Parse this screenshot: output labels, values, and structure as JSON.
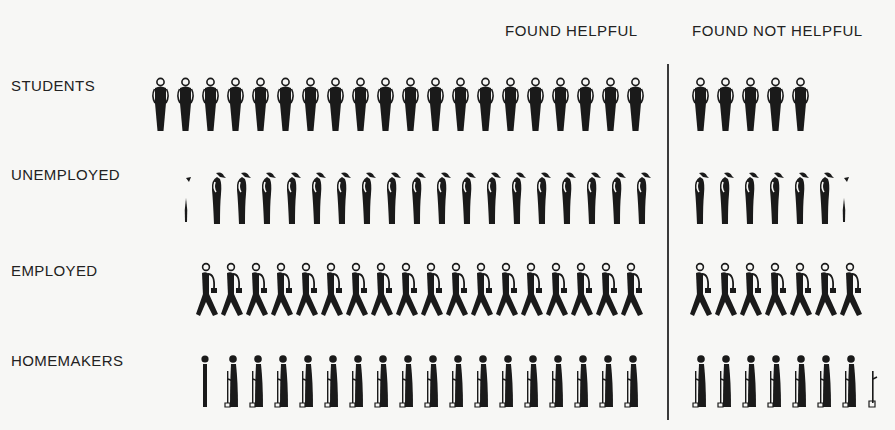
{
  "chart_data": {
    "type": "pictogram",
    "title": "",
    "columns": [
      "FOUND HELPFUL",
      "FOUND NOT HELPFUL"
    ],
    "categories": [
      "STUDENTS",
      "UNEMPLOYED",
      "EMPLOYED",
      "HOMEMAKERS"
    ],
    "series": [
      {
        "name": "FOUND HELPFUL",
        "values": [
          20,
          18.3,
          18,
          17.5
        ]
      },
      {
        "name": "FOUND NOT HELPFUL",
        "values": [
          5,
          6.5,
          7,
          7.3
        ]
      }
    ],
    "icons": {
      "STUDENTS": "standing-student-figure",
      "UNEMPLOYED": "stooped-man-figure",
      "EMPLOYED": "walking-man-with-briefcase-figure",
      "HOMEMAKERS": "woman-with-broom-figure"
    },
    "layout": {
      "divider": "vertical line between columns",
      "grid": false,
      "legend": "column headers at top"
    }
  },
  "headers": {
    "helpful": "FOUND HELPFUL",
    "not_helpful": "FOUND NOT HELPFUL"
  },
  "rows": [
    {
      "label": "STUDENTS",
      "helpful_full": 20,
      "helpful_partial": 0,
      "not_full": 5,
      "not_partial": 0
    },
    {
      "label": "UNEMPLOYED",
      "helpful_full": 18,
      "helpful_partial": 1,
      "not_full": 6,
      "not_partial": 1
    },
    {
      "label": "EMPLOYED",
      "helpful_full": 18,
      "helpful_partial": 0,
      "not_full": 7,
      "not_partial": 0
    },
    {
      "label": "HOMEMAKERS",
      "helpful_full": 17,
      "helpful_partial": 1,
      "not_full": 7,
      "not_partial": 1
    }
  ],
  "colors": {
    "ink": "#1a1a1a",
    "paper": "#f7f7f5"
  }
}
